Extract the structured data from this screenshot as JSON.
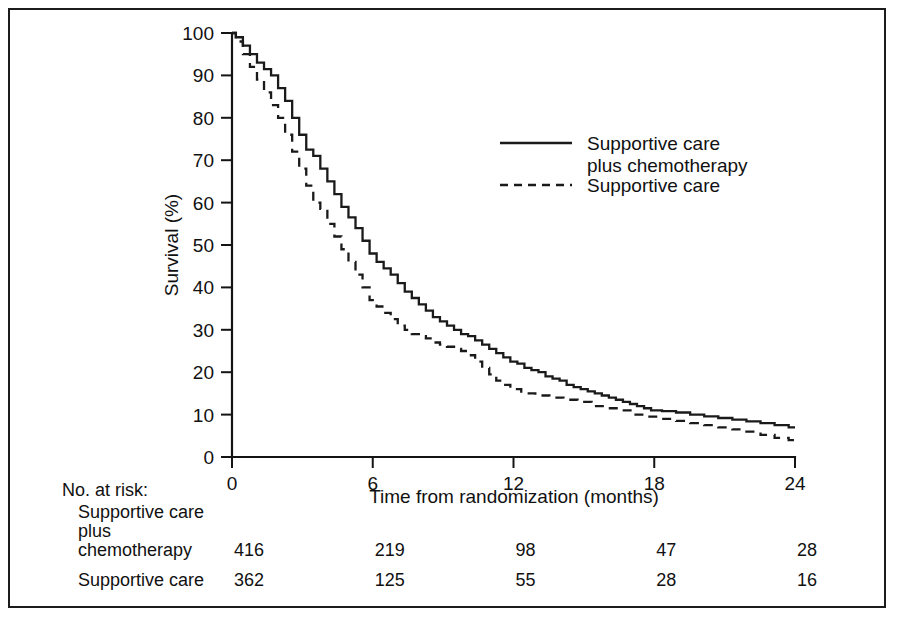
{
  "figure": {
    "border_color": "#1c1c1c",
    "background": "#ffffff"
  },
  "chart_data": {
    "type": "line",
    "title": "",
    "subtitle": "",
    "xlabel": "Time from randomization (months)",
    "ylabel": "Survival (%)",
    "xlim": [
      0,
      24
    ],
    "ylim": [
      0,
      100
    ],
    "xticks": [
      0,
      6,
      12,
      18,
      24
    ],
    "xtick_labels": [
      "0",
      "6",
      "12",
      "18",
      "24"
    ],
    "yticks": [
      0,
      10,
      20,
      30,
      40,
      50,
      60,
      70,
      80,
      90,
      100
    ],
    "ytick_labels": [
      "0",
      "10",
      "20",
      "30",
      "40",
      "50",
      "60",
      "70",
      "80",
      "90",
      "100"
    ],
    "grid": false,
    "legend_position": "upper-right-inside",
    "curve_style": "kaplan-meier-step",
    "series": [
      {
        "name": "Supportive care plus chemotherapy",
        "style": "solid",
        "color": "#1a1a1a",
        "x": [
          0,
          0.3,
          0.6,
          0.9,
          1.2,
          1.5,
          1.8,
          2.1,
          2.4,
          2.7,
          3.0,
          3.3,
          3.6,
          3.9,
          4.2,
          4.5,
          4.8,
          5.1,
          5.4,
          5.7,
          6.0,
          6.3,
          6.6,
          6.9,
          7.2,
          7.5,
          7.8,
          8.1,
          8.4,
          8.7,
          9.0,
          9.3,
          9.6,
          9.9,
          10.2,
          10.5,
          10.8,
          11.1,
          11.4,
          11.7,
          12.0,
          12.3,
          12.6,
          12.9,
          13.2,
          13.5,
          13.8,
          14.1,
          14.4,
          14.7,
          15.0,
          15.3,
          15.6,
          15.9,
          16.2,
          16.5,
          16.8,
          17.1,
          17.4,
          17.7,
          18.0,
          18.6,
          19.2,
          19.8,
          20.4,
          21.0,
          21.6,
          22.2,
          22.8,
          23.4,
          24.0
        ],
        "y": [
          100,
          99,
          97,
          95,
          93,
          91.5,
          90,
          87,
          84,
          80,
          76,
          72.5,
          71,
          68,
          65,
          62,
          59,
          56.5,
          54,
          51,
          48,
          46,
          44.5,
          43,
          41,
          39,
          37.5,
          36,
          34.5,
          33,
          32,
          31,
          30,
          29,
          28.5,
          27.5,
          26.5,
          25.5,
          24.5,
          23.5,
          22.5,
          22,
          21,
          20.5,
          20,
          19,
          18.5,
          18,
          17,
          16.5,
          16,
          15.5,
          15,
          14.5,
          14,
          13.5,
          13,
          12.5,
          12,
          11.5,
          11,
          10.8,
          10.5,
          10,
          9.6,
          9.2,
          8.8,
          8.4,
          8,
          7.5,
          7
        ]
      },
      {
        "name": "Supportive care",
        "style": "dashed",
        "color": "#1a1a1a",
        "x": [
          0,
          0.3,
          0.6,
          0.9,
          1.2,
          1.5,
          1.8,
          2.1,
          2.4,
          2.7,
          3.0,
          3.3,
          3.6,
          3.9,
          4.2,
          4.5,
          4.8,
          5.1,
          5.4,
          5.7,
          6.0,
          6.3,
          6.6,
          6.9,
          7.2,
          7.5,
          7.8,
          8.1,
          8.4,
          8.7,
          9.0,
          9.3,
          9.6,
          9.9,
          10.2,
          10.5,
          10.8,
          11.1,
          11.4,
          11.7,
          12.0,
          12.6,
          13.2,
          13.8,
          14.4,
          15.0,
          15.6,
          16.2,
          16.8,
          17.4,
          18.0,
          18.6,
          19.2,
          19.8,
          20.4,
          21.0,
          21.6,
          22.2,
          22.8,
          23.4,
          24.0
        ],
        "y": [
          100,
          98,
          95,
          92,
          89,
          86,
          83,
          80,
          76,
          72,
          68,
          64,
          60,
          58.5,
          55,
          52,
          49,
          46,
          43,
          40,
          37,
          35.5,
          34,
          32.5,
          31,
          30,
          29,
          28.5,
          28,
          27,
          26.5,
          26,
          25.5,
          25,
          24,
          22.5,
          21,
          19.5,
          18,
          17,
          16,
          15,
          14.5,
          14,
          13.5,
          13,
          12,
          11.5,
          11,
          10,
          9.5,
          9,
          8.5,
          8,
          7.5,
          7,
          6.5,
          6,
          5.2,
          4.5,
          4
        ]
      }
    ],
    "legend": [
      {
        "label_line1": "Supportive care",
        "label_line2": "plus chemotherapy",
        "style": "solid"
      },
      {
        "label_line1": "Supportive care",
        "label_line2": "",
        "style": "dashed"
      }
    ],
    "risk_table": {
      "title": "No. at risk:",
      "time_points": [
        0,
        6,
        12,
        18,
        24
      ],
      "rows": [
        {
          "label_lines": [
            "Supportive care",
            "plus",
            "chemotherapy"
          ],
          "values": [
            "416",
            "219",
            "98",
            "47",
            "28"
          ]
        },
        {
          "label_lines": [
            "Supportive care"
          ],
          "values": [
            "362",
            "125",
            "55",
            "28",
            "16"
          ]
        }
      ]
    }
  }
}
